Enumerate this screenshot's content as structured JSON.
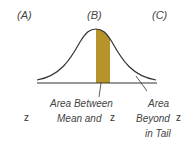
{
  "columns": {
    "a_label": "(A)",
    "b_label": "(B)",
    "c_label": "(C)"
  },
  "colors": {
    "shaded_area": "#B8922A",
    "curve": "#333333",
    "axis": "#333333"
  },
  "annotations": {
    "between_line1": "Area Between",
    "between_line2": "Mean and",
    "between_z": "z",
    "beyond_line1": "Area",
    "beyond_line2": "Beyond",
    "beyond_z": "z",
    "beyond_line3": "in Tail"
  },
  "column_a_value": "z"
}
